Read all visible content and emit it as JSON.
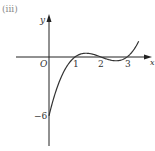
{
  "panel_label": "(iii)",
  "chart_data": {
    "type": "line",
    "title": "",
    "xlabel": "x",
    "ylabel": "y",
    "origin_label": "O",
    "x_tick_labels": [
      "1",
      "2",
      "3"
    ],
    "y_tick_labels": [
      "-6"
    ],
    "function": "y = (x-1)(x-2)(x-3)",
    "x": [
      0,
      0.5,
      1,
      1.42,
      2,
      2.58,
      3,
      3.4
    ],
    "values": [
      -6,
      -1.875,
      0,
      0.385,
      0,
      -0.385,
      0,
      0.96
    ],
    "xlim": [
      -1,
      3.9
    ],
    "ylim": [
      -9,
      4
    ],
    "grid": false,
    "legend": null,
    "annotations": [
      "x-intercepts at 1, 2, 3",
      "y-intercept at -6"
    ]
  },
  "labels": {
    "x_axis": "x",
    "y_axis": "y",
    "origin": "O",
    "tick1": "1",
    "tick2": "2",
    "tick3": "3",
    "y_intercept": "−6"
  }
}
